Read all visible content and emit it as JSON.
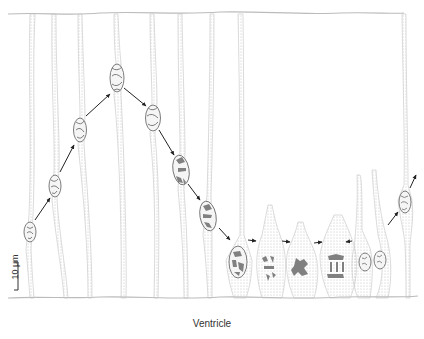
{
  "figure": {
    "caption": "Ventricle",
    "scale_bar": {
      "label": "10 μm"
    },
    "colors": {
      "membrane": "#b8b8b8",
      "nucleus_outline": "#6e6e6e",
      "chromatin": "#7a7a7a",
      "arrow": "#222222",
      "stipple": "#cfcfcf"
    },
    "cells": [
      {
        "id": 1,
        "x": 27,
        "nucleus_y": 232,
        "phase": "G1 (basal)"
      },
      {
        "id": 2,
        "x": 55,
        "nucleus_y": 185,
        "phase": "G1"
      },
      {
        "id": 3,
        "x": 80,
        "nucleus_y": 130,
        "phase": "S"
      },
      {
        "id": 4,
        "x": 117,
        "nucleus_y": 78,
        "phase": "S (apex of migration)"
      },
      {
        "id": 5,
        "x": 152,
        "nucleus_y": 118,
        "phase": "G2"
      },
      {
        "id": 6,
        "x": 180,
        "nucleus_y": 170,
        "phase": "G2"
      },
      {
        "id": 7,
        "x": 207,
        "nucleus_y": 216,
        "phase": "G2 late"
      },
      {
        "id": 8,
        "x": 238,
        "nucleus_y": 262,
        "phase": "Prophase"
      },
      {
        "id": 9,
        "x": 270,
        "nucleus_y": 268,
        "phase": "Prometaphase"
      },
      {
        "id": 10,
        "x": 302,
        "nucleus_y": 270,
        "phase": "Metaphase"
      },
      {
        "id": 11,
        "x": 336,
        "nucleus_y": 266,
        "phase": "Anaphase/Telophase"
      },
      {
        "id": 12,
        "x": 372,
        "nucleus_y": 262,
        "phase": "Daughter cells"
      },
      {
        "id": 13,
        "x": 405,
        "nucleus_y": 202,
        "phase": "G1 (returning)"
      }
    ]
  }
}
